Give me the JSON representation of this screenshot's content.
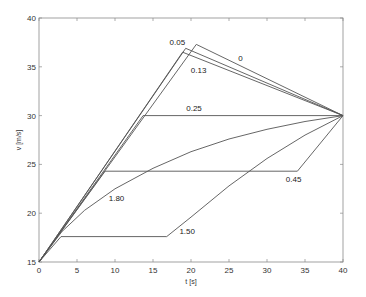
{
  "chart_data": {
    "type": "line",
    "title": "",
    "xlabel": "t [s]",
    "ylabel": "v [m/s]",
    "xlim": [
      0,
      40
    ],
    "ylim": [
      15,
      40
    ],
    "xticks": [
      0,
      5,
      10,
      15,
      20,
      25,
      30,
      35,
      40
    ],
    "yticks": [
      15,
      20,
      25,
      30,
      35,
      40
    ],
    "grid": false,
    "legend": "none (inline curve labels)",
    "line_color": "#555555",
    "series": [
      {
        "name": "0",
        "label_pos": [
          26.5,
          35.6
        ],
        "x": [
          0,
          20.7,
          40
        ],
        "y": [
          15,
          37.3,
          30
        ]
      },
      {
        "name": "0.05",
        "label_pos": [
          18.2,
          37.2
        ],
        "x": [
          0,
          19.3,
          40
        ],
        "y": [
          15,
          36.9,
          30
        ]
      },
      {
        "name": "0.13",
        "label_pos": [
          21.0,
          34.4
        ],
        "x": [
          0,
          18.9,
          40
        ],
        "y": [
          15,
          36.5,
          30
        ]
      },
      {
        "name": "0.25",
        "label_pos": [
          20.4,
          30.5
        ],
        "x": [
          0,
          13.7,
          40
        ],
        "y": [
          15,
          30.0,
          30
        ]
      },
      {
        "name": "0.45",
        "label_pos": [
          33.5,
          23.2
        ],
        "x": [
          0,
          8.7,
          34.0,
          40
        ],
        "y": [
          15,
          24.3,
          24.3,
          30
        ]
      },
      {
        "name": "1.80",
        "label_pos": [
          10.2,
          21.2
        ],
        "x": [
          0,
          3,
          6,
          10,
          15,
          20,
          25,
          30,
          35,
          40
        ],
        "y": [
          15,
          18.1,
          20.3,
          22.5,
          24.6,
          26.3,
          27.6,
          28.6,
          29.4,
          30
        ]
      },
      {
        "name": "1.50",
        "label_pos": [
          19.5,
          17.9
        ],
        "x": [
          0,
          2.9,
          16.8,
          20,
          25,
          30,
          35,
          40
        ],
        "y": [
          15,
          17.6,
          17.6,
          19.6,
          22.8,
          25.6,
          28.0,
          30
        ]
      }
    ]
  },
  "axes": {
    "xlabel": "t [s]",
    "ylabel": "v [m/s]"
  }
}
